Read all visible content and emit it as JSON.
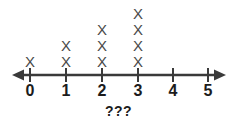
{
  "caption": "???",
  "chart_data": {
    "type": "bar",
    "plot_style": "dot-plot",
    "title": "",
    "subtitle": "",
    "xlabel": "???",
    "ylabel": "",
    "categories": [
      "0",
      "1",
      "2",
      "3",
      "4",
      "5"
    ],
    "values": [
      1,
      2,
      3,
      4,
      0,
      0
    ],
    "marker": "X",
    "axis_labels": [
      "0",
      "1",
      "2",
      "3",
      "4",
      "5"
    ],
    "xlim": [
      0,
      5
    ],
    "ylim": [
      0,
      4
    ],
    "grid": false,
    "legend": null,
    "axis_arrows": [
      "left",
      "right"
    ],
    "colors": {
      "marker": "#4a4a4a",
      "axis": "#3a3a3a",
      "label": "#1c1c1c",
      "background": "#ffffff"
    },
    "annotations": []
  },
  "geometry": {
    "tick_x": [
      30,
      66,
      102,
      138,
      173,
      208
    ],
    "axis_y": 75,
    "label_y": 90,
    "stack_step": 16,
    "stack_base_y": 61,
    "axis_x_start": 14,
    "axis_x_end": 224
  }
}
